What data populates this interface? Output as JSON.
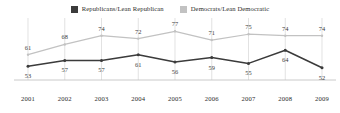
{
  "legend": {
    "position": "top-center",
    "entries": [
      {
        "label": "Republicans/Lean Republican",
        "color": "#3b3b3b",
        "icon": "square-swatch-icon"
      },
      {
        "label": "Democrats/Lean Democratic",
        "color": "#c2c2c2",
        "icon": "square-swatch-icon"
      }
    ]
  },
  "chart_data": {
    "type": "line",
    "title": "",
    "subtitle": "",
    "xlabel": "",
    "ylabel": "",
    "grid": "vertical",
    "ylim": [
      45,
      82
    ],
    "xlim": [
      2001,
      2009
    ],
    "categories": [
      "2001",
      "2002",
      "2003",
      "2004",
      "2005",
      "2006",
      "2007",
      "2008",
      "2009"
    ],
    "legend_position": "top-center",
    "series": [
      {
        "name": "Republicans/Lean Republican",
        "color": "#3b3b3b",
        "label_position": "below",
        "values": [
          53,
          57,
          57,
          61,
          56,
          59,
          55,
          64,
          52
        ]
      },
      {
        "name": "Democrats/Lean Democratic",
        "color": "#c2c2c2",
        "label_position": "above",
        "values": [
          61,
          68,
          74,
          72,
          77,
          71,
          75,
          74,
          74
        ]
      }
    ]
  },
  "colors": {
    "republican": "#3b3b3b",
    "democrat": "#c2c2c2",
    "gridline": "#d5d5d5",
    "baseline": "#bdbdbd",
    "text": "#2b2b2b"
  }
}
